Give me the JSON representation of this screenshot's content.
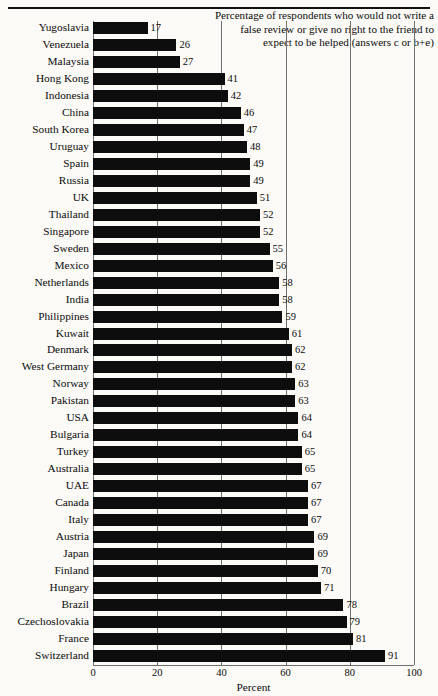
{
  "caption": {
    "text": "Percentage of respondents who would not write a false review or give no right to the friend to expect to be helped (answers c or b+e)"
  },
  "chart_data": {
    "type": "bar",
    "orientation": "horizontal",
    "title": "",
    "subtitle": "",
    "annotation": "Percentage of respondents who would not write a false review or give no right to the friend to expect to be helped (answers c or b+e)",
    "xlabel": "Percent",
    "ylabel": "",
    "xlim": [
      0,
      100
    ],
    "xticks": [
      0,
      20,
      40,
      60,
      80,
      100
    ],
    "xtick_labels": [
      "0",
      "20",
      "40",
      "60",
      "80",
      "100"
    ],
    "grid": "vertical",
    "legend": "none",
    "bar_color": "#0d0d0d",
    "gridline_color": "#6f6f6f",
    "background_color": "#fbfaf7",
    "categories": [
      "Yugoslavia",
      "Venezuela",
      "Malaysia",
      "Hong Kong",
      "Indonesia",
      "China",
      "South Korea",
      "Uruguay",
      "Spain",
      "Russia",
      "UK",
      "Thailand",
      "Singapore",
      "Sweden",
      "Mexico",
      "Netherlands",
      "India",
      "Philippines",
      "Kuwait",
      "Denmark",
      "West Germany",
      "Norway",
      "Pakistan",
      "USA",
      "Bulgaria",
      "Turkey",
      "Australia",
      "UAE",
      "Canada",
      "Italy",
      "Austria",
      "Japan",
      "Finland",
      "Hungary",
      "Brazil",
      "Czechoslovakia",
      "France",
      "Switzerland"
    ],
    "values": [
      17,
      26,
      27,
      41,
      42,
      46,
      47,
      48,
      49,
      49,
      51,
      52,
      52,
      55,
      56,
      58,
      58,
      59,
      61,
      62,
      62,
      63,
      63,
      64,
      64,
      65,
      65,
      67,
      67,
      67,
      69,
      69,
      70,
      71,
      78,
      79,
      81,
      91
    ],
    "value_labels": [
      "17",
      "26",
      "27",
      "41",
      "42",
      "46",
      "47",
      "48",
      "49",
      "49",
      "51",
      "52",
      "52",
      "55",
      "56",
      "58",
      "58",
      "59",
      "61",
      "62",
      "62",
      "63",
      "63",
      "64",
      "64",
      "65",
      "65",
      "67",
      "67",
      "67",
      "69",
      "69",
      "70",
      "71",
      "78",
      "79",
      "81",
      "91"
    ]
  }
}
